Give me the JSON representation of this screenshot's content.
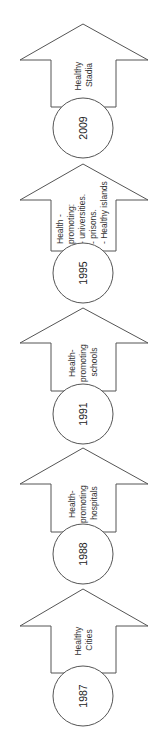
{
  "diagram": {
    "orientation": "rotated-90-ccw",
    "milestones": [
      {
        "year": "2009",
        "label_lines": [
          "Healthy",
          "Stadia"
        ]
      },
      {
        "year": "1995",
        "label_lines": [
          "Health -",
          "promoting:",
          "- universities.",
          "- prisons.",
          "- Healthy islands"
        ]
      },
      {
        "year": "1991",
        "label_lines": [
          "Health-",
          "promoting",
          "schools"
        ]
      },
      {
        "year": "1988",
        "label_lines": [
          "Health-",
          "promoting",
          "hospitals"
        ]
      },
      {
        "year": "1987",
        "label_lines": [
          "Healthy",
          "Cities"
        ]
      }
    ]
  }
}
